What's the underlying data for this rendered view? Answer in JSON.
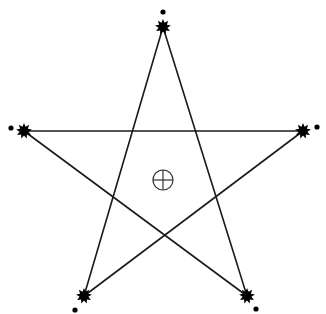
{
  "diagram": {
    "type": "pentagram",
    "line_color": "#1a1a1a",
    "marker_color": "#000000",
    "vertices": [
      {
        "name": "top",
        "star": [
          163,
          27
        ],
        "dot": [
          163,
          12
        ]
      },
      {
        "name": "right",
        "star": [
          303,
          131
        ],
        "dot": [
          317,
          127
        ]
      },
      {
        "name": "bottom-right",
        "star": [
          247,
          296
        ],
        "dot": [
          256,
          309
        ]
      },
      {
        "name": "bottom-left",
        "star": [
          84,
          296
        ],
        "dot": [
          75,
          310
        ]
      },
      {
        "name": "left",
        "star": [
          24,
          131
        ],
        "dot": [
          11,
          128
        ]
      }
    ],
    "edges": [
      [
        "top",
        "bottom-left"
      ],
      [
        "top",
        "bottom-right"
      ],
      [
        "left",
        "right"
      ],
      [
        "left",
        "bottom-right"
      ],
      [
        "right",
        "bottom-left"
      ]
    ],
    "center_symbol": {
      "icon": "circle-cross",
      "center": [
        163,
        180
      ],
      "radius": 10
    }
  }
}
